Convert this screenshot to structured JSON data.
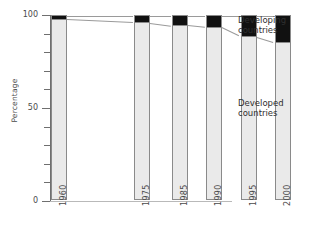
{
  "chart_data": {
    "type": "bar",
    "subtype": "stacked-100-percent",
    "title": "",
    "xlabel": "",
    "ylabel": "Percentage",
    "ylim": [
      0,
      100
    ],
    "yticks": [
      0,
      50,
      100
    ],
    "ytick_labels": [
      "0",
      "50",
      "100"
    ],
    "yminor_ticks": [
      10,
      20,
      30,
      40,
      60,
      70,
      80,
      90
    ],
    "grid": false,
    "legend_position": "right",
    "categories": [
      "1960",
      "1975",
      "1985",
      "1990",
      "1995",
      "2000"
    ],
    "series": [
      {
        "name": "Developed countries",
        "color": "#eaeaea",
        "values": [
          98.5,
          96.5,
          95.0,
          94.0,
          89.0,
          86.0
        ]
      },
      {
        "name": "Developing countries",
        "color": "#111111",
        "values": [
          1.5,
          3.5,
          5.0,
          6.0,
          11.0,
          14.0
        ]
      }
    ],
    "annotations": [
      "Developing countries",
      "Developed countries"
    ]
  },
  "axis": {
    "y_title": "Percentage",
    "y_labels": {
      "top": "100",
      "mid": "50",
      "bottom": "0"
    }
  },
  "legend": {
    "developing": {
      "line1": "Developing",
      "line2": "countries"
    },
    "developed": {
      "line1": "Developed",
      "line2": "countries"
    }
  },
  "xticks": {
    "t0": "1960",
    "t1": "1975",
    "t2": "1985",
    "t3": "1990",
    "t4": "1995",
    "t5": "2000"
  }
}
